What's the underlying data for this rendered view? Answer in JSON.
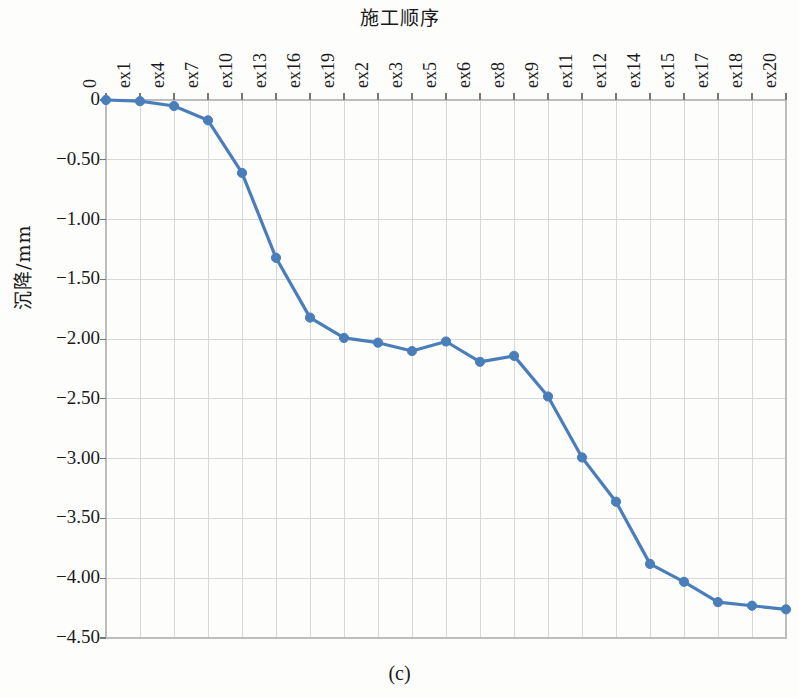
{
  "figure": {
    "caption": "(c)",
    "x_axis_title": "施工顺序",
    "y_axis_title": "沉降/mm"
  },
  "style": {
    "line_color": "#4a7ebb",
    "marker_color": "#4a7ebb",
    "grid_color": "#d8d8d8",
    "axis_color": "#bdbdbd",
    "text_color": "#1a1a1a"
  },
  "chart_data": {
    "type": "line",
    "title": "施工顺序",
    "subtitle": "(c)",
    "xlabel": "施工顺序",
    "ylabel": "沉降/mm",
    "categories": [
      "0",
      "ex1",
      "ex4",
      "ex7",
      "ex10",
      "ex13",
      "ex16",
      "ex19",
      "ex2",
      "ex3",
      "ex5",
      "ex6",
      "ex8",
      "ex9",
      "ex11",
      "ex12",
      "ex14",
      "ex15",
      "ex17",
      "ex18",
      "ex20"
    ],
    "values": [
      0.0,
      -0.01,
      -0.05,
      -0.17,
      -0.61,
      -1.32,
      -1.82,
      -1.99,
      -2.03,
      -2.1,
      -2.02,
      -2.19,
      -2.14,
      -2.48,
      -2.99,
      -3.36,
      -3.88,
      -4.03,
      -4.2,
      -4.23,
      -4.26
    ],
    "ylim": [
      -4.5,
      0.0
    ],
    "ytick_labels": [
      "0",
      "−0.50",
      "−1.00",
      "−1.50",
      "−2.00",
      "−2.50",
      "−3.00",
      "−3.50",
      "−4.00",
      "−4.50"
    ],
    "ytick_values": [
      0,
      -0.5,
      -1.0,
      -1.5,
      -2.0,
      -2.5,
      -3.0,
      -3.5,
      -4.0,
      -4.5
    ],
    "grid": true,
    "legend": null,
    "marker": "circle",
    "series": [
      {
        "name": "沉降/mm",
        "values": [
          0.0,
          -0.01,
          -0.05,
          -0.17,
          -0.61,
          -1.32,
          -1.82,
          -1.99,
          -2.03,
          -2.1,
          -2.02,
          -2.19,
          -2.14,
          -2.48,
          -2.99,
          -3.36,
          -3.88,
          -4.03,
          -4.2,
          -4.23,
          -4.26
        ]
      }
    ]
  }
}
